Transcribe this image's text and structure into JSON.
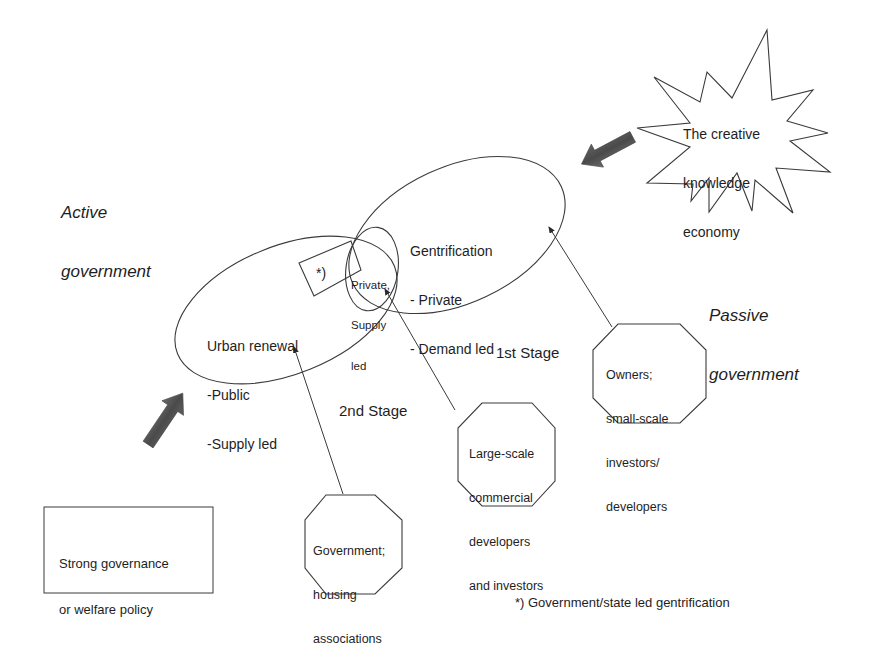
{
  "labels": {
    "active_government": [
      "Active",
      "government"
    ],
    "passive_government": [
      "Passive",
      "government"
    ],
    "creative_economy": [
      "The creative",
      "knowledge",
      "economy"
    ],
    "gentrification": [
      "Gentrification",
      "- Private",
      "- Demand led"
    ],
    "urban_renewal": [
      "Urban renewal",
      "-Public",
      "-Supply led"
    ],
    "private_supply_led": [
      "Private,",
      "Supply",
      "led"
    ],
    "state_led_marker": "*)",
    "stage_1": "1st Stage",
    "stage_2": "2nd Stage",
    "owners": [
      "Owners;",
      "small-scale",
      "investors/",
      "developers"
    ],
    "large_scale": [
      "Large-scale",
      "commercial",
      "developers",
      "and investors"
    ],
    "government_housing": [
      "Government;",
      "housing",
      "associations"
    ],
    "strong_governance": [
      "Strong governance",
      "or welfare policy"
    ],
    "footnote": "*) Government/state led gentrification"
  },
  "colors": {
    "stroke": "#3a3a3a",
    "text": "#1e1e1e",
    "block_arrow": "#555555",
    "background": "#ffffff"
  }
}
